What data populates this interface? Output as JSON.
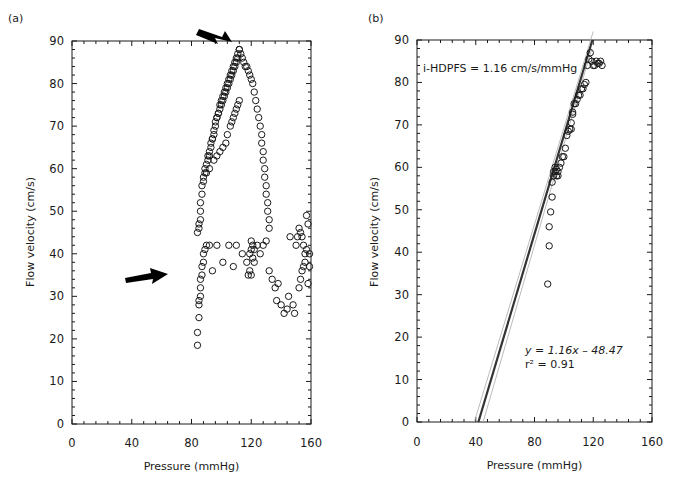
{
  "figure": {
    "panels": [
      {
        "id": "a",
        "label": "(a)",
        "xlabel": "Pressure (mmHg)",
        "ylabel": "Flow velocity (cm/s)",
        "x_ticks": [
          "0",
          "40",
          "80",
          "120",
          "160"
        ],
        "y_ticks": [
          "0",
          "10",
          "20",
          "30",
          "40",
          "50",
          "60",
          "70",
          "80",
          "90"
        ]
      },
      {
        "id": "b",
        "label": "(b)",
        "xlabel": "Pressure (mmHg)",
        "ylabel": "Flow velocity (cm/s)",
        "x_ticks": [
          "0",
          "40",
          "80",
          "120",
          "160"
        ],
        "y_ticks": [
          "0",
          "10",
          "20",
          "30",
          "40",
          "50",
          "60",
          "70",
          "80",
          "90"
        ],
        "annotation_top": "i-HDPFS = 1.16 cm/s/mmHg",
        "equation": "y = 1.16x – 48.47",
        "r_squared": "r² = 0.91"
      }
    ]
  },
  "chart_data": [
    {
      "type": "scatter",
      "panel": "(a)",
      "title": "",
      "xlabel": "Pressure (mmHg)",
      "ylabel": "Flow velocity (cm/s)",
      "xlim": [
        0,
        160
      ],
      "ylim": [
        0,
        90
      ],
      "x_ticks": [
        0,
        40,
        80,
        120,
        160
      ],
      "y_ticks": [
        0,
        10,
        20,
        30,
        40,
        50,
        60,
        70,
        80,
        90
      ],
      "grid": false,
      "marker": "open-circle",
      "annotations": [
        {
          "type": "arrow",
          "pointing_to": [
            110,
            88
          ],
          "description": "arrow at peak flow velocity"
        },
        {
          "type": "arrow",
          "pointing_to": [
            85,
            34
          ],
          "description": "arrow at low-velocity cluster near 85 mmHg"
        }
      ],
      "series": [
        {
          "name": "ascending limb",
          "x": [
            84,
            85,
            85,
            86,
            86,
            86,
            87,
            87,
            88,
            88,
            89,
            89,
            90,
            90,
            91,
            91,
            92,
            92,
            93,
            93,
            94,
            94,
            95,
            95,
            96,
            96,
            97,
            97,
            98,
            98,
            99,
            99,
            100,
            100,
            101,
            101,
            102,
            102,
            103,
            103,
            104,
            104,
            105,
            105,
            106,
            106,
            107,
            107,
            108,
            108,
            109,
            109,
            110,
            110,
            111,
            111,
            112,
            112
          ],
          "y": [
            45,
            46,
            47,
            48,
            50,
            52,
            54,
            56,
            57,
            58,
            59,
            60,
            59,
            61,
            62,
            63,
            63,
            64,
            65,
            66,
            67,
            67,
            68,
            69,
            70,
            71,
            72,
            72,
            73,
            73,
            74,
            75,
            75,
            76,
            76,
            77,
            77,
            78,
            78,
            79,
            79,
            80,
            80,
            81,
            81,
            82,
            82,
            83,
            83,
            84,
            84,
            85,
            85,
            86,
            86,
            87,
            88,
            88
          ]
        },
        {
          "name": "descending limb",
          "x": [
            113,
            114,
            115,
            116,
            117,
            118,
            119,
            120,
            121,
            122,
            123,
            124,
            125,
            126,
            127,
            127,
            128,
            128,
            129,
            129,
            130,
            130,
            131,
            131,
            132,
            132
          ],
          "y": [
            87,
            86,
            85,
            84,
            84,
            83,
            82,
            81,
            80,
            78,
            76,
            74,
            72,
            70,
            68,
            66,
            64,
            62,
            60,
            58,
            56,
            54,
            52,
            50,
            48,
            46
          ]
        },
        {
          "name": "secondary loop",
          "x": [
            92,
            95,
            97,
            99,
            101,
            103,
            104,
            106,
            107,
            108,
            109,
            110,
            111,
            112
          ],
          "y": [
            60,
            62,
            63,
            64,
            65,
            66,
            68,
            70,
            71,
            72,
            73,
            74,
            75,
            76
          ]
        },
        {
          "name": "low-velocity cluster",
          "x": [
            84,
            84,
            85,
            85,
            85,
            86,
            86,
            86,
            87,
            87,
            88,
            88,
            89,
            90,
            92,
            94,
            97,
            101,
            105,
            108,
            110,
            114,
            117,
            118,
            119,
            119,
            120,
            120,
            120,
            121,
            121,
            122,
            122,
            124,
            126,
            128,
            130,
            132,
            134,
            136,
            137,
            138,
            140,
            142,
            144,
            145,
            146,
            148,
            149,
            150,
            151,
            152,
            152,
            153,
            153,
            154,
            154,
            155,
            155,
            156,
            156,
            157,
            157,
            158,
            158,
            159,
            159
          ],
          "y": [
            18.5,
            21.5,
            25,
            28,
            29,
            30,
            32,
            34,
            35,
            37,
            38,
            40,
            41,
            42,
            42,
            36,
            42,
            38,
            42,
            37,
            42,
            40,
            38,
            35,
            36,
            40,
            41,
            43,
            35,
            42,
            39,
            41,
            38,
            42,
            40,
            42,
            43,
            36,
            34,
            32,
            29,
            33,
            28,
            26,
            27,
            30,
            44,
            28,
            26,
            42,
            44,
            32,
            46,
            34,
            45,
            36,
            44,
            37,
            42,
            38,
            40,
            41,
            49,
            47,
            33,
            37,
            40
          ]
        }
      ]
    },
    {
      "type": "scatter",
      "panel": "(b)",
      "title": "",
      "xlabel": "Pressure (mmHg)",
      "ylabel": "Flow velocity (cm/s)",
      "xlim": [
        0,
        160
      ],
      "ylim": [
        0,
        90
      ],
      "x_ticks": [
        0,
        40,
        80,
        120,
        160
      ],
      "y_ticks": [
        0,
        10,
        20,
        30,
        40,
        50,
        60,
        70,
        80,
        90
      ],
      "grid": false,
      "marker": "open-circle",
      "annotations": [
        {
          "text": "i-HDPFS = 1.16 cm/s/mmHg",
          "position": [
            8,
            84
          ]
        },
        {
          "text": "y = 1.16x – 48.47",
          "position": [
            84,
            15
          ]
        },
        {
          "text": "r² = 0.91",
          "position": [
            84,
            11.5
          ]
        }
      ],
      "series": [
        {
          "name": "data",
          "x": [
            89,
            90,
            90,
            91,
            92,
            92,
            93,
            93,
            94,
            94,
            95,
            95,
            96,
            96,
            97,
            98,
            99,
            100,
            101,
            102,
            103,
            104,
            105,
            105,
            106,
            106,
            107,
            108,
            109,
            110,
            111,
            112,
            113,
            114,
            115,
            116,
            117,
            118,
            119,
            120,
            121,
            122,
            123,
            124,
            125,
            126
          ],
          "y": [
            32.5,
            41.5,
            46,
            49.5,
            53,
            56.5,
            58,
            59,
            60,
            59,
            58,
            59.5,
            58,
            59,
            60,
            61,
            62.5,
            62.5,
            64.5,
            67.5,
            68.5,
            69,
            69,
            70.5,
            72.5,
            73,
            75,
            75,
            76,
            77,
            77,
            78.5,
            78.5,
            79.5,
            80,
            84,
            85.5,
            87,
            85,
            84,
            84,
            85,
            84.5,
            84.5,
            85,
            84
          ]
        },
        {
          "name": "regression fit",
          "type": "line",
          "slope": 1.16,
          "intercept": -48.47,
          "x": [
            41.8,
            119.4
          ],
          "y": [
            0,
            90
          ]
        },
        {
          "name": "confidence band upper",
          "type": "line",
          "x": [
            39,
            120
          ],
          "y": [
            0,
            92
          ]
        },
        {
          "name": "confidence band lower",
          "type": "line",
          "x": [
            45,
            119
          ],
          "y": [
            0,
            88
          ]
        }
      ]
    }
  ]
}
